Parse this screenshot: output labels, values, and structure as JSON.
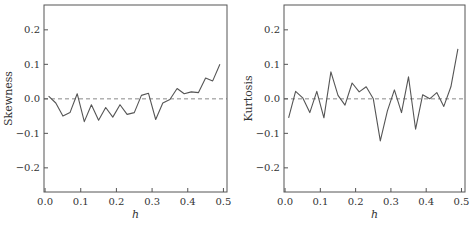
{
  "chart_data": [
    {
      "type": "line",
      "title": "",
      "xlabel": "h",
      "ylabel": "Skewness",
      "xlim": [
        -0.003,
        0.51
      ],
      "ylim": [
        -0.27,
        0.272
      ],
      "xticks": [
        0.0,
        0.1,
        0.2,
        0.3,
        0.4,
        0.5
      ],
      "xtick_labels": [
        "0.0",
        "0.1",
        "0.2",
        "0.3",
        "0.4",
        "0.5"
      ],
      "yticks": [
        -0.2,
        -0.1,
        0.0,
        0.1,
        0.2
      ],
      "ytick_labels": [
        "−0.2",
        "−0.1",
        "0.0",
        "0.1",
        "0.2"
      ],
      "grid": false,
      "reference_line": {
        "y": 0.0,
        "style": "dashed"
      },
      "x": [
        0.01,
        0.03,
        0.05,
        0.07,
        0.09,
        0.11,
        0.13,
        0.15,
        0.17,
        0.19,
        0.21,
        0.23,
        0.25,
        0.27,
        0.29,
        0.31,
        0.33,
        0.35,
        0.37,
        0.39,
        0.41,
        0.43,
        0.45,
        0.47,
        0.49
      ],
      "series": [
        {
          "name": "Skewness",
          "values": [
            0.008,
            -0.012,
            -0.05,
            -0.04,
            0.015,
            -0.066,
            -0.017,
            -0.062,
            -0.025,
            -0.053,
            -0.017,
            -0.045,
            -0.04,
            0.01,
            0.016,
            -0.06,
            -0.012,
            -0.002,
            0.03,
            0.015,
            0.02,
            0.018,
            0.06,
            0.052,
            0.1
          ]
        }
      ]
    },
    {
      "type": "line",
      "title": "",
      "xlabel": "h",
      "ylabel": "Kurtosis",
      "xlim": [
        -0.003,
        0.51
      ],
      "ylim": [
        -0.27,
        0.272
      ],
      "xticks": [
        0.0,
        0.1,
        0.2,
        0.3,
        0.4,
        0.5
      ],
      "xtick_labels": [
        "0.0",
        "0.1",
        "0.2",
        "0.3",
        "0.4",
        "0.5"
      ],
      "yticks": [
        -0.2,
        -0.1,
        0.0,
        0.1,
        0.2
      ],
      "ytick_labels": [
        "−0.2",
        "−0.1",
        "0.0",
        "0.1",
        "0.2"
      ],
      "grid": false,
      "reference_line": {
        "y": 0.0,
        "style": "dashed"
      },
      "x": [
        0.01,
        0.03,
        0.05,
        0.07,
        0.09,
        0.11,
        0.13,
        0.15,
        0.17,
        0.19,
        0.21,
        0.23,
        0.25,
        0.27,
        0.29,
        0.31,
        0.33,
        0.35,
        0.37,
        0.39,
        0.41,
        0.43,
        0.45,
        0.47,
        0.49
      ],
      "series": [
        {
          "name": "Kurtosis",
          "values": [
            -0.055,
            0.022,
            0.003,
            -0.04,
            0.022,
            -0.055,
            0.078,
            0.01,
            -0.018,
            0.046,
            0.02,
            0.035,
            0.0,
            -0.122,
            -0.035,
            0.026,
            -0.04,
            0.064,
            -0.088,
            0.012,
            0.0,
            0.018,
            -0.022,
            0.035,
            0.145
          ]
        }
      ]
    }
  ],
  "style": {
    "line_color": "#555555",
    "axis_color": "#555555",
    "dash_color": "#888888"
  }
}
